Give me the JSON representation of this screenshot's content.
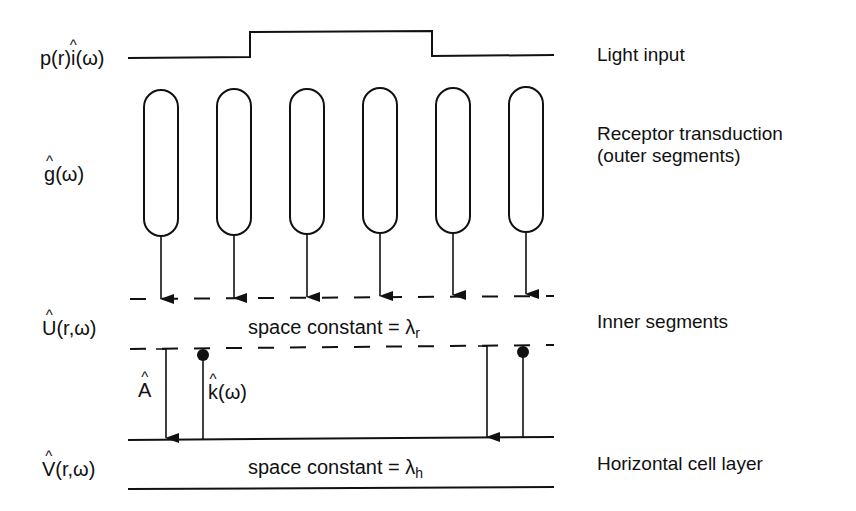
{
  "diagram": {
    "type": "retina-model-schematic",
    "signals": {
      "light_input_symbol": {
        "prefix": "p(r)",
        "hat_letter": "i",
        "suffix": "(ω)"
      },
      "receptor_symbol": {
        "hat_letter": "g",
        "suffix": "(ω)"
      },
      "inner_symbol": {
        "hat_letter": "U",
        "suffix": "(r,ω)"
      },
      "horizontal_symbol": {
        "hat_letter": "V",
        "suffix": "(r,ω)"
      },
      "feedforward_symbol": {
        "hat_letter": "A",
        "suffix": ""
      },
      "feedback_symbol": {
        "hat_letter": "k",
        "suffix": "(ω)"
      }
    },
    "layers": [
      {
        "label": "Light input"
      },
      {
        "label": "Receptor transduction",
        "label_line2": "(outer segments)"
      },
      {
        "label": "Inner segments"
      },
      {
        "label": "Horizontal cell layer"
      }
    ],
    "space_constants": {
      "inner": {
        "text": "space constant = λ",
        "subscript": "r"
      },
      "horizontal": {
        "text": "space constant = λ",
        "subscript": "h"
      }
    },
    "receptor_count": 6,
    "receptor_x": [
      161,
      234,
      307,
      380,
      453,
      526
    ],
    "colors": {
      "stroke": "#111111",
      "background": "#ffffff"
    }
  }
}
